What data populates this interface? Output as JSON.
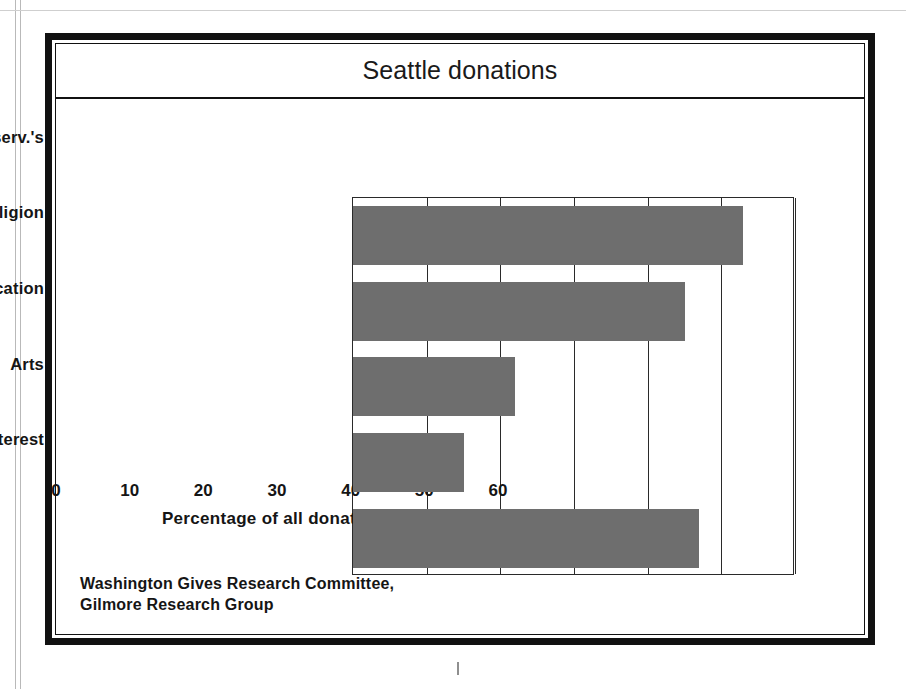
{
  "figure": {
    "title": "Seattle donations",
    "source_lines": [
      "Washington Gives Research Committee,",
      "Gilmore Research Group"
    ]
  },
  "colors": {
    "bar_fill": "#6e6e6e",
    "axis": "#2a2a2a",
    "frame": "#111111",
    "text": "#151515",
    "background": "#ffffff"
  },
  "chart_data": {
    "type": "bar",
    "orientation": "horizontal",
    "title": "Seattle donations",
    "xlabel": "Percentage of all donations",
    "ylabel": "",
    "xlim": [
      0,
      60
    ],
    "xticks": [
      0,
      10,
      20,
      30,
      40,
      50,
      60
    ],
    "xtick_labels": [
      "0",
      "10",
      "20",
      "30",
      "40",
      "50",
      "60"
    ],
    "grid": "vertical",
    "legend": "none",
    "categories": [
      "Health/human serv.'s",
      "Church/religion",
      "Education",
      "Arts",
      "More than 1 interest"
    ],
    "values": [
      53,
      45,
      22,
      15,
      47
    ],
    "series": [
      {
        "name": "Percentage of all donations",
        "values": [
          53,
          45,
          22,
          15,
          47
        ]
      }
    ]
  }
}
